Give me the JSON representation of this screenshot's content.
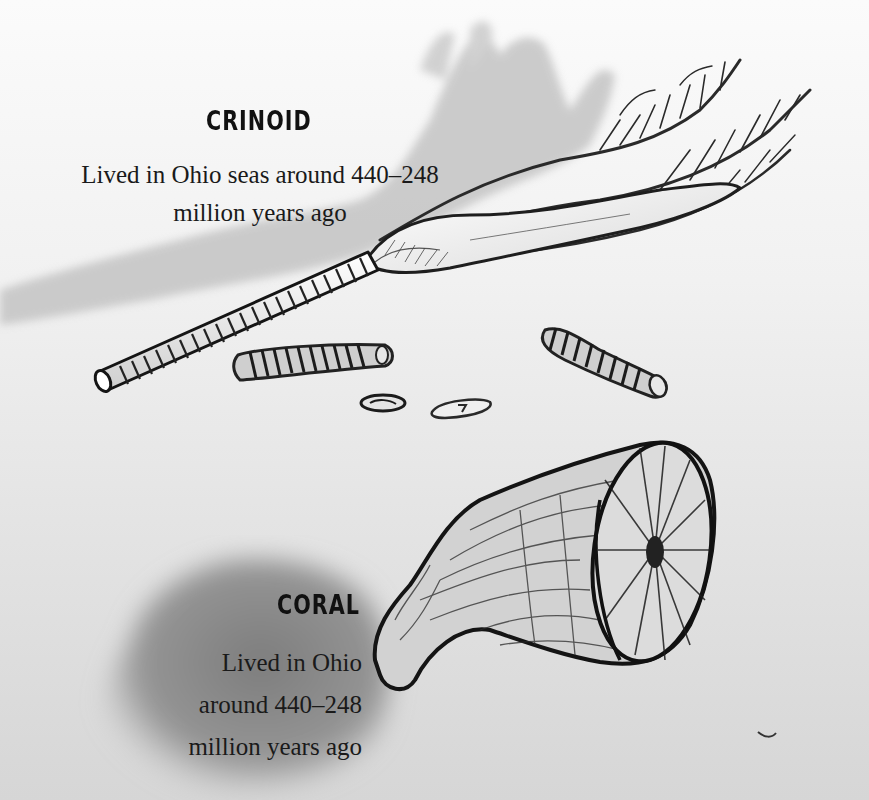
{
  "crinoid": {
    "title": "CRINOID",
    "caption_line1": "Lived in Ohio seas around 440–248",
    "caption_line2": "million years ago"
  },
  "coral": {
    "title": "CORAL",
    "caption_line1": "Lived in Ohio",
    "caption_line2": "around 440–248",
    "caption_line3": "million years ago"
  },
  "colors": {
    "ink": "#1a1a1a",
    "shadow_wash": "#b8b8b8",
    "coral_shadow": "#8f8f8f",
    "paper_light": "#fbfbfb",
    "paper_dark": "#d6d6d6"
  }
}
